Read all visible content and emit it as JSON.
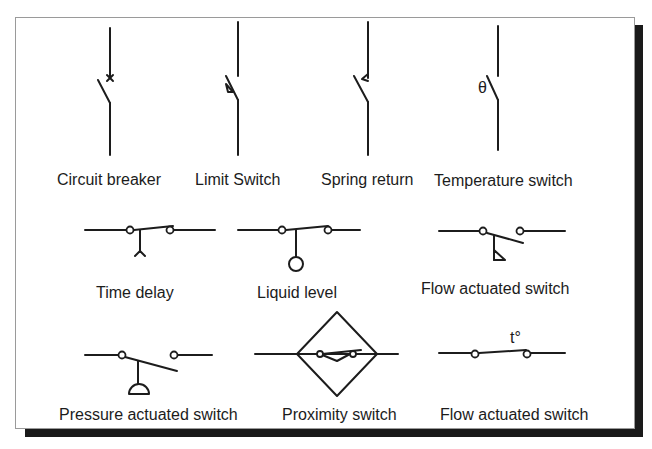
{
  "symbols": [
    {
      "id": "circuit-breaker",
      "label": "Circuit breaker"
    },
    {
      "id": "limit-switch",
      "label": "Limit Switch"
    },
    {
      "id": "spring-return",
      "label": "Spring return"
    },
    {
      "id": "temperature-switch",
      "label": "Temperature switch",
      "marker": "θ"
    },
    {
      "id": "time-delay",
      "label": "Time delay"
    },
    {
      "id": "liquid-level",
      "label": "Liquid level"
    },
    {
      "id": "flow-actuated-switch-1",
      "label": "Flow actuated switch"
    },
    {
      "id": "pressure-actuated-switch",
      "label": "Pressure actuated switch"
    },
    {
      "id": "proximity-switch",
      "label": "Proximity switch"
    },
    {
      "id": "flow-actuated-switch-2",
      "label": "Flow actuated switch",
      "marker": "t°"
    }
  ]
}
